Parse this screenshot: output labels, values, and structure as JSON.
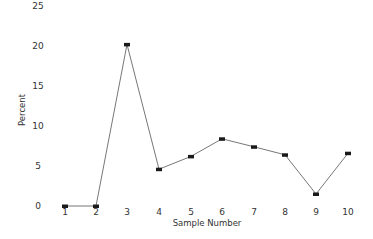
{
  "chart_data": {
    "type": "line",
    "title": "",
    "xlabel": "Sample Number",
    "ylabel": "Percent",
    "x": [
      1,
      2,
      3,
      4,
      5,
      6,
      7,
      8,
      9,
      10
    ],
    "categories": [
      "1",
      "2",
      "3",
      "4",
      "5",
      "6",
      "7",
      "8",
      "9",
      "10"
    ],
    "series": [
      {
        "name": "Percent",
        "values": [
          0,
          0,
          20.2,
          4.6,
          6.2,
          8.4,
          7.4,
          6.4,
          1.5,
          6.6
        ]
      }
    ],
    "ylim": [
      0,
      25
    ],
    "yticks": [
      0,
      5,
      10,
      15,
      20,
      25
    ],
    "xticks": [
      1,
      2,
      3,
      4,
      5,
      6,
      7,
      8,
      9,
      10
    ],
    "grid": false,
    "legend": null,
    "marker": "filled-rectangle",
    "colors": {
      "line": "#777777",
      "marker": "#1a1a1a",
      "text": "#333333",
      "background": "#ffffff"
    }
  },
  "layout": {
    "x_pixels": [
      65,
      96,
      127,
      159,
      191,
      222,
      254,
      285,
      316,
      348
    ],
    "y_zero_px": 206,
    "px_per_unit": 8.0,
    "ytick_label_x": 38,
    "xtick_label_y": 215
  }
}
